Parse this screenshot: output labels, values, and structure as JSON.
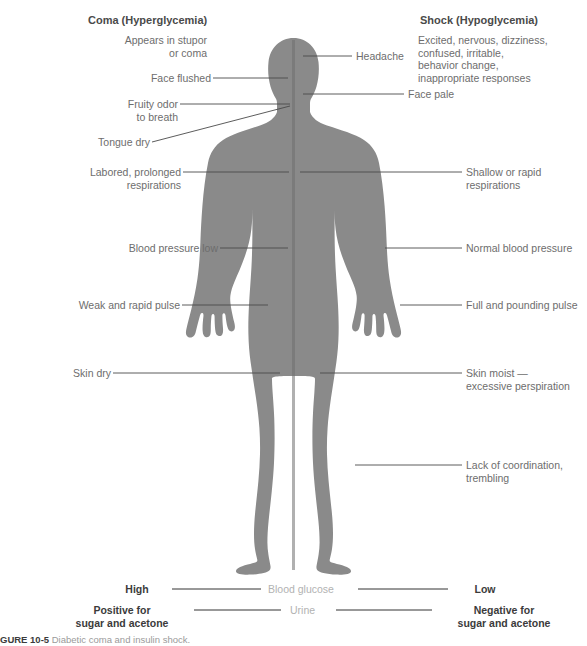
{
  "figure": {
    "body_color": "#8a8a8a",
    "divider_color": "#6f6f6f",
    "leader_color": "#4a4a4a",
    "label_color": "#6d6d6d",
    "heading_color": "#4a4a4a",
    "scale_word_color": "#b2b2b2",
    "scale_end_color": "#3b3b3b",
    "background": "#ffffff"
  },
  "left_column": {
    "heading": "Coma (Hyperglycemia)",
    "intro": "Appears in stupor\nor coma",
    "labels": [
      {
        "text": "Face flushed"
      },
      {
        "text": "Fruity odor\nto breath"
      },
      {
        "text": "Tongue dry"
      },
      {
        "text": "Labored, prolonged\nrespirations"
      },
      {
        "text": "Blood pressure low"
      },
      {
        "text": "Weak and rapid pulse"
      },
      {
        "text": "Skin dry"
      }
    ]
  },
  "right_column": {
    "heading": "Shock (Hypoglycemia)",
    "intro": "Excited, nervous, dizziness,\nconfused, irritable,\nbehavior change,\ninappropriate responses",
    "labels": [
      {
        "text": "Headache"
      },
      {
        "text": "Face pale"
      },
      {
        "text": "Shallow or rapid\nrespirations"
      },
      {
        "text": "Normal blood pressure"
      },
      {
        "text": "Full and pounding pulse"
      },
      {
        "text": "Skin moist —\nexcessive perspiration"
      },
      {
        "text": "Lack of coordination,\ntrembling"
      }
    ]
  },
  "scales": [
    {
      "measure": "Blood glucose",
      "left_value": "High",
      "right_value": "Low"
    },
    {
      "measure": "Urine",
      "left_value": "Positive for\nsugar and acetone",
      "right_value": "Negative for\nsugar and acetone"
    }
  ],
  "caption": {
    "label": "GURE 10-5",
    "text": "Diabetic coma and insulin shock."
  }
}
